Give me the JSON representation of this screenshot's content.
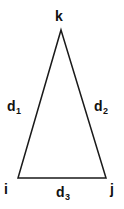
{
  "diagram": {
    "type": "triangle",
    "background_color": "#ffffff",
    "stroke_color": "#1a1a1a",
    "stroke_width": 1.5,
    "text_color": "#111111",
    "vertices": [
      {
        "name": "i",
        "label": "i",
        "x": 18,
        "y": 178,
        "position": "bottom-left"
      },
      {
        "name": "j",
        "label": "j",
        "x": 106,
        "y": 178,
        "position": "bottom-right"
      },
      {
        "name": "k",
        "label": "k",
        "x": 61,
        "y": 30,
        "position": "apex"
      }
    ],
    "edges": [
      {
        "name": "d1",
        "base": "d",
        "subscript": "1",
        "from": "i",
        "to": "k",
        "position": "left"
      },
      {
        "name": "d2",
        "base": "d",
        "subscript": "2",
        "from": "k",
        "to": "j",
        "position": "right"
      },
      {
        "name": "d3",
        "base": "d",
        "subscript": "3",
        "from": "i",
        "to": "j",
        "position": "bottom"
      }
    ],
    "labels": {
      "vertex_i": "i",
      "vertex_j": "j",
      "vertex_k": "k",
      "edge_d_base": "d",
      "edge_d1_sub": "1",
      "edge_d2_sub": "2",
      "edge_d3_sub": "3"
    }
  }
}
